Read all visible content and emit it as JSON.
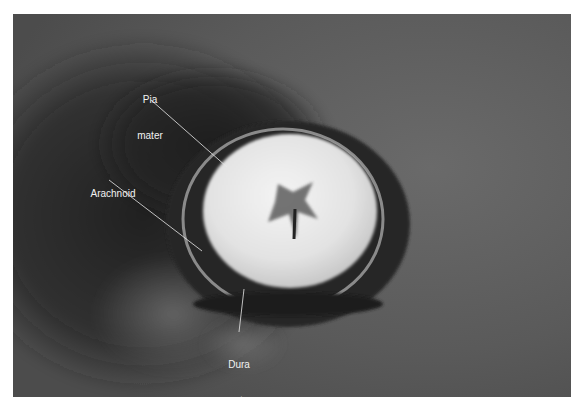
{
  "figure": {
    "labels": [
      {
        "id": "pia",
        "line1": "Pia",
        "line2": "mater"
      },
      {
        "id": "arachnoid",
        "line1": "Arachnoid"
      },
      {
        "id": "dura",
        "line1": "Dura",
        "line2": "mater"
      }
    ]
  },
  "colors": {
    "background": "#4a4a4a",
    "cord": "#e6e6e6",
    "label_text": "#f2f2f2",
    "page": "#ffffff"
  }
}
